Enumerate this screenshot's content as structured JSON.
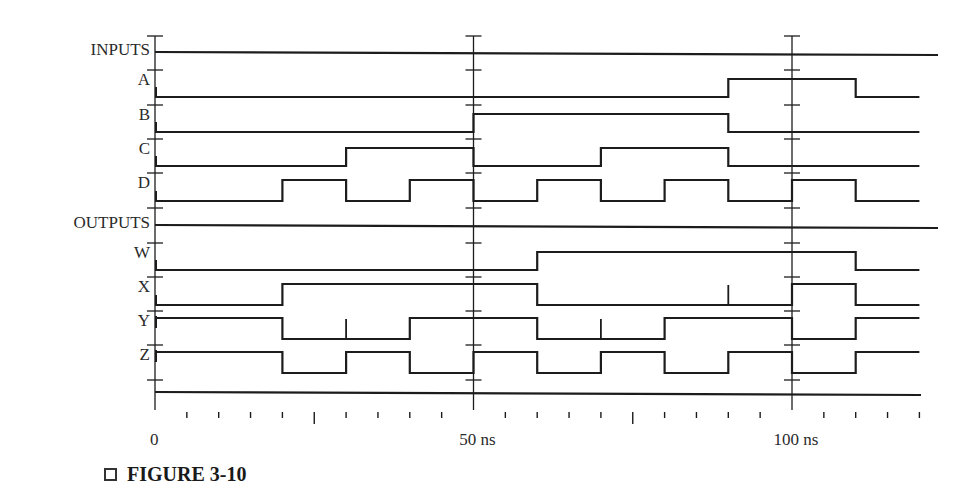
{
  "figure": {
    "caption": "FIGURE 3-10",
    "caption_icon": "square-box-icon"
  },
  "colors": {
    "line": "#1c1c1c",
    "background": "#ffffff"
  },
  "axis": {
    "labels": [
      {
        "t": 0,
        "text": "0"
      },
      {
        "t": 50,
        "text": "50 ns"
      },
      {
        "t": 100,
        "text": "100 ns"
      }
    ],
    "unit": "ns",
    "range": [
      0,
      120
    ],
    "minor_tick_every": 5,
    "major_tick_every": 25
  },
  "groups": {
    "inputs_label": "INPUTS",
    "outputs_label": "OUTPUTS"
  },
  "chart_data": {
    "type": "timing",
    "title": "FIGURE 3-10",
    "xlabel": "time (ns)",
    "xlim": [
      0,
      120
    ],
    "x_tick_labels": [
      "0",
      "50 ns",
      "100 ns"
    ],
    "groups": [
      {
        "name": "INPUTS",
        "signals": [
          {
            "name": "A",
            "transitions": [
              [
                0,
                0
              ],
              [
                90,
                1
              ],
              [
                110,
                0
              ]
            ]
          },
          {
            "name": "B",
            "transitions": [
              [
                0,
                0
              ],
              [
                50,
                1
              ],
              [
                90,
                0
              ]
            ]
          },
          {
            "name": "C",
            "transitions": [
              [
                0,
                0
              ],
              [
                30,
                1
              ],
              [
                50,
                0
              ],
              [
                70,
                1
              ],
              [
                90,
                0
              ]
            ]
          },
          {
            "name": "D",
            "transitions": [
              [
                0,
                0
              ],
              [
                20,
                1
              ],
              [
                30,
                0
              ],
              [
                40,
                1
              ],
              [
                50,
                0
              ],
              [
                60,
                1
              ],
              [
                70,
                0
              ],
              [
                80,
                1
              ],
              [
                90,
                0
              ],
              [
                100,
                1
              ],
              [
                110,
                0
              ]
            ]
          }
        ]
      },
      {
        "name": "OUTPUTS",
        "signals": [
          {
            "name": "W",
            "transitions": [
              [
                0,
                0
              ],
              [
                60,
                1
              ],
              [
                110,
                0
              ]
            ]
          },
          {
            "name": "X",
            "transitions": [
              [
                0,
                0
              ],
              [
                20,
                1
              ],
              [
                60,
                0
              ],
              [
                100,
                1
              ],
              [
                110,
                0
              ]
            ],
            "glitches": [
              90
            ]
          },
          {
            "name": "Y",
            "transitions": [
              [
                0,
                1
              ],
              [
                20,
                0
              ],
              [
                40,
                1
              ],
              [
                60,
                0
              ],
              [
                80,
                1
              ],
              [
                100,
                0
              ],
              [
                110,
                1
              ]
            ],
            "glitches": [
              30,
              70
            ]
          },
          {
            "name": "Z",
            "transitions": [
              [
                0,
                1
              ],
              [
                20,
                0
              ],
              [
                30,
                1
              ],
              [
                40,
                0
              ],
              [
                50,
                1
              ],
              [
                60,
                0
              ],
              [
                70,
                1
              ],
              [
                80,
                0
              ],
              [
                90,
                1
              ],
              [
                100,
                0
              ],
              [
                110,
                1
              ]
            ]
          }
        ]
      }
    ]
  }
}
